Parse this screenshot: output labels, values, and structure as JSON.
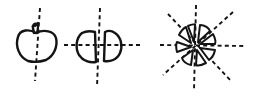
{
  "diagram": {
    "description": "Hand-drawn sketch of an apple, the apple cut in half along symmetry axes, and an apple exploded into radial wedges",
    "stroke_color": "#141414",
    "background_color": "#ffffff",
    "panels": [
      {
        "id": "whole-apple",
        "label": "Whole apple with vertical dashed axis",
        "axes": 1,
        "pieces": 1
      },
      {
        "id": "halved-apple",
        "label": "Apple split into two halves with horizontal and vertical dashed axes",
        "axes": 2,
        "pieces": 2
      },
      {
        "id": "exploded-apple",
        "label": "Apple split into eight wedges with radial dashed axes",
        "axes": 4,
        "pieces": 8
      }
    ]
  }
}
